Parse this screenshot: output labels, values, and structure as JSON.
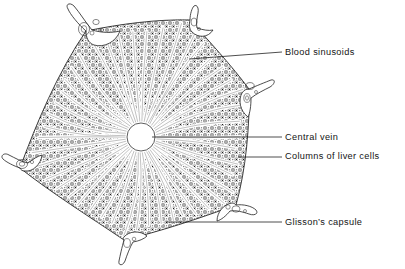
{
  "figure": {
    "background_color": "#ffffff",
    "ink_color": "#141414",
    "width": 405,
    "height": 269
  },
  "callouts": [
    {
      "id": "blood-sinusoids",
      "label": "Blood sinusoids",
      "text_x": 285,
      "text_y": 48,
      "leader_x1": 189,
      "leader_y1": 59,
      "leader_x2": 282,
      "leader_y2": 52
    },
    {
      "id": "central-vein",
      "label": "Central vein",
      "text_x": 285,
      "text_y": 133,
      "leader_x1": 152,
      "leader_y1": 137,
      "leader_x2": 282,
      "leader_y2": 137
    },
    {
      "id": "columns-of-liver-cells",
      "label": "Columns of liver cells",
      "text_x": 285,
      "text_y": 152,
      "leader_x1": 238,
      "leader_y1": 157,
      "leader_x2": 282,
      "leader_y2": 157
    },
    {
      "id": "glissons-capsule",
      "label": "Glisson’s capsule",
      "text_x": 285,
      "text_y": 218,
      "leader_x1": 166,
      "leader_y1": 222,
      "leader_x2": 282,
      "leader_y2": 222
    }
  ],
  "structures": {
    "central_vein": {
      "cx": 141,
      "cy": 137,
      "r": 14
    },
    "lobule_vertices": [
      {
        "x": 86,
        "y": 31
      },
      {
        "x": 190,
        "y": 20
      },
      {
        "x": 249,
        "y": 89
      },
      {
        "x": 236,
        "y": 205
      },
      {
        "x": 124,
        "y": 240
      },
      {
        "x": 20,
        "y": 168
      }
    ],
    "portal_triads": [
      {
        "id": "portal-triad-top-left",
        "x": 72,
        "y": 28
      },
      {
        "id": "portal-triad-top-right",
        "x": 192,
        "y": 19
      },
      {
        "id": "portal-triad-right",
        "x": 243,
        "y": 89
      },
      {
        "id": "portal-triad-bottom-right",
        "x": 231,
        "y": 200
      },
      {
        "id": "portal-triad-bottom",
        "x": 124,
        "y": 237
      },
      {
        "id": "portal-triad-left",
        "x": 25,
        "y": 164
      }
    ],
    "sinusoid_ray_count": 46,
    "cell_column_count": 46
  }
}
